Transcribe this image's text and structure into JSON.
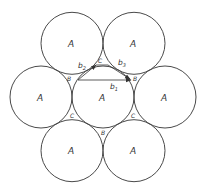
{
  "diagram": {
    "type": "hexagonal-close-packing",
    "stroke_color": "#4a4a4a",
    "background": "#ffffff",
    "circles": [
      {
        "id": "center",
        "label": "A"
      },
      {
        "id": "left",
        "label": "A"
      },
      {
        "id": "right",
        "label": "A"
      },
      {
        "id": "top-left",
        "label": "A"
      },
      {
        "id": "top-right",
        "label": "A"
      },
      {
        "id": "bottom-left",
        "label": "A"
      },
      {
        "id": "bottom-right",
        "label": "A"
      }
    ],
    "interstices": [
      {
        "position": "top",
        "label": "C"
      },
      {
        "position": "upper-left",
        "label": "B"
      },
      {
        "position": "upper-right",
        "label": "B"
      },
      {
        "position": "lower-left",
        "label": "C"
      },
      {
        "position": "lower-right",
        "label": "C"
      },
      {
        "position": "bottom",
        "label": "B"
      }
    ],
    "vectors": [
      {
        "id": "b1",
        "label": "b",
        "subscript": "1"
      },
      {
        "id": "b2",
        "label": "b",
        "subscript": "2"
      },
      {
        "id": "b3",
        "label": "b",
        "subscript": "3"
      }
    ]
  }
}
